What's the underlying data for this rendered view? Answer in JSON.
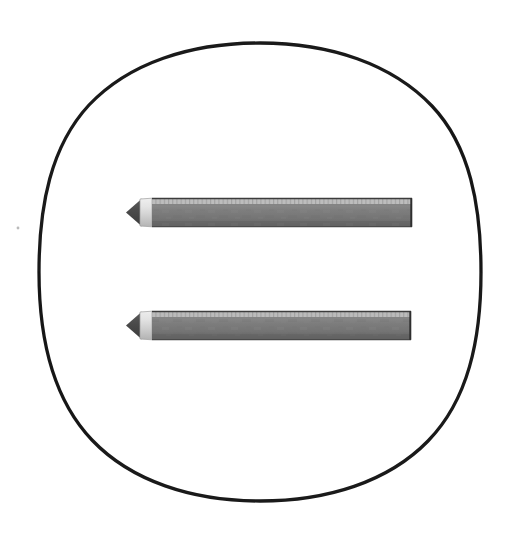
{
  "canvas": {
    "width": 518,
    "height": 547,
    "background_color": "#ffffff",
    "description": "Line drawing of an equals sign formed by two horizontal pencils inside a hand-drawn circle"
  },
  "circle": {
    "name": "hand-drawn circle outline",
    "stroke_color": "#1a1a1a",
    "fill_color": "#ffffff",
    "stroke_width": 3.2,
    "center_x": 260,
    "center_y": 272,
    "radius_x": 221,
    "radius_y": 229,
    "left_edge_x": 39,
    "right_edge_x": 481,
    "top_edge_y": 43,
    "bottom_edge_y": 501
  },
  "speck": {
    "name": "stray ink speck",
    "x": 18,
    "y": 228,
    "radius": 1.4,
    "color": "#8c8c8c"
  },
  "colors": {
    "graphite_tip": "#4a4a4a",
    "graphite_tip_dark": "#3a3a3a",
    "wood_cone_light": "#e2e2e2",
    "wood_cone_mid": "#c9c9c9",
    "barrel_highlight": "#b9b9b9",
    "barrel_body": "#7d7d7d",
    "barrel_body_dark": "#6e6e6e",
    "barrel_shadow": "#636363",
    "outline": "#3d3d3d",
    "hatch_line": "#9a9a9a",
    "end_cap_line": "#2f2f2f"
  },
  "pencils": [
    {
      "name": "upper pencil",
      "label": "Pencil 1 (top bar of equals sign)",
      "tip_x": 126,
      "body_left_x": 152,
      "right_x": 412,
      "top_y": 198,
      "bottom_y": 227,
      "height": 29,
      "length": 286,
      "highlight_band_height": 6,
      "hatch_count": 62,
      "tip_style": "sharpened point",
      "right_end_style": "flat blunt cap"
    },
    {
      "name": "lower pencil",
      "label": "Pencil 2 (bottom bar of equals sign)",
      "tip_x": 126,
      "body_left_x": 152,
      "right_x": 411,
      "top_y": 311,
      "bottom_y": 340,
      "height": 29,
      "length": 285,
      "highlight_band_height": 6,
      "hatch_count": 62,
      "tip_style": "sharpened point",
      "right_end_style": "flat blunt cap"
    }
  ],
  "meta": {
    "title": "Equals sign drawn with two pencils"
  }
}
